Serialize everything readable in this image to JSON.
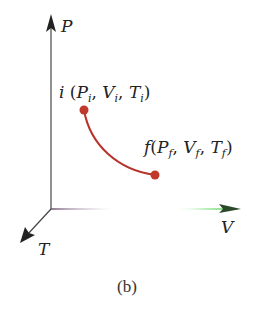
{
  "figure": {
    "caption": "(b)",
    "axes": {
      "vertical": "P",
      "horizontal": "V",
      "depth": "T"
    },
    "points": {
      "initial": {
        "name": "i",
        "open": " (",
        "p": "P",
        "p_sub": "i",
        "v": "V",
        "v_sub": "i",
        "t": "T",
        "t_sub": "i",
        "close": ")"
      },
      "final": {
        "name": "f",
        "open": "(",
        "p": "P",
        "p_sub": "f",
        "v": "V",
        "v_sub": "f",
        "t": "T",
        "t_sub": "f",
        "close": ")"
      }
    },
    "colors": {
      "curve": "#b5342c",
      "axis": "#333333",
      "v_axis_start": "#8a6a8a",
      "v_axis_end": "#3fc73f"
    }
  }
}
